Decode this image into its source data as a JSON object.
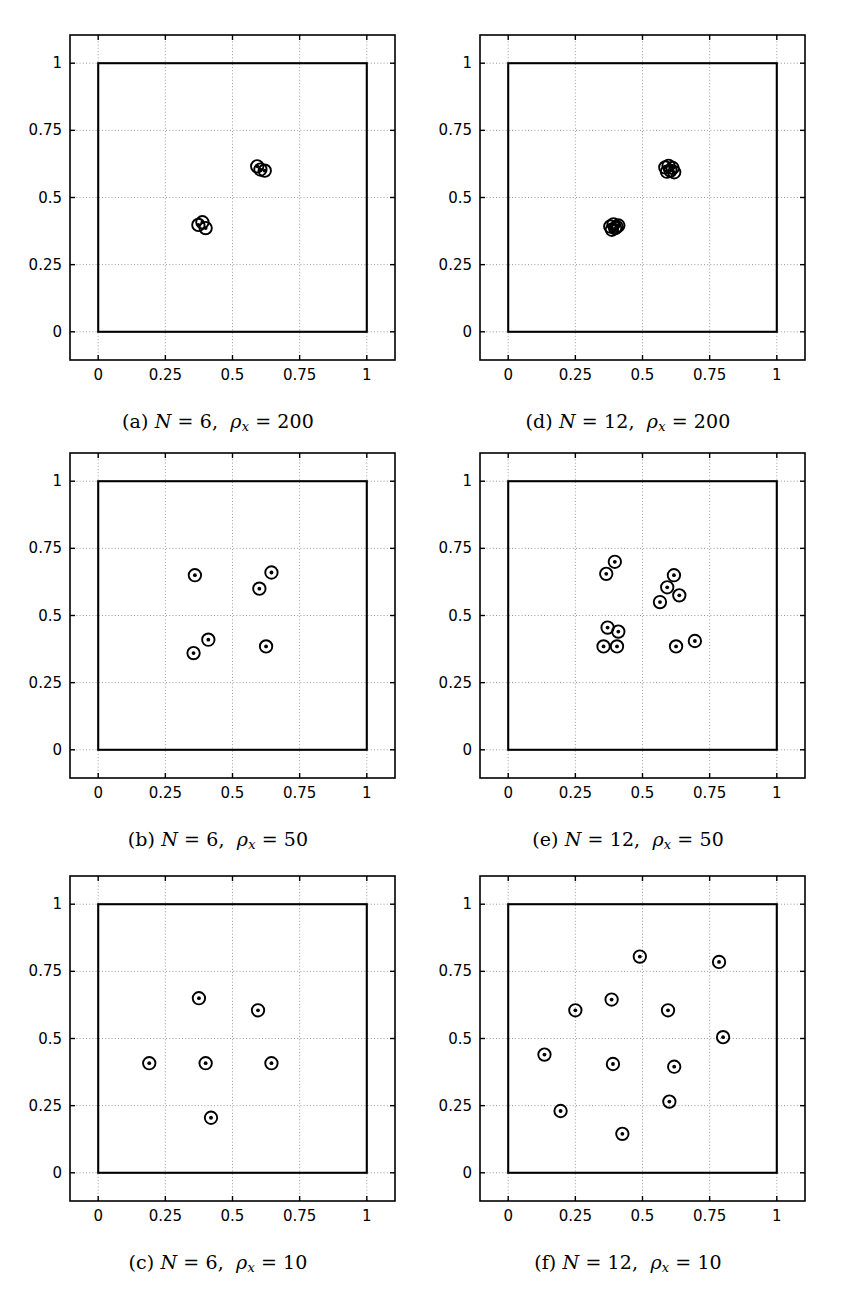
{
  "figure": {
    "title": "",
    "panel_count": 6,
    "columns": 2,
    "rows": 3
  },
  "axes": {
    "xticks": [
      "0",
      "0.25",
      "0.5",
      "0.75",
      "1"
    ],
    "yticks": [
      "0",
      "0.25",
      "0.5",
      "0.75",
      "1"
    ],
    "xtick_values": [
      0,
      0.25,
      0.5,
      0.75,
      1
    ],
    "ytick_values": [
      0,
      0.25,
      0.5,
      0.75,
      1
    ],
    "xlim": [
      -0.105,
      1.105
    ],
    "ylim": [
      -0.105,
      1.105
    ],
    "grid": "dotted",
    "unit_square": [
      0,
      0,
      1,
      1
    ],
    "marker": "circle-with-dot"
  },
  "chart_data": [
    {
      "id": "a",
      "type": "scatter",
      "title": "(a) N = 6, ρx = 200",
      "caption_parts": {
        "label": "(a)",
        "N_symbol": "N",
        "N_value": "6",
        "rho_symbol": "ρ",
        "rho_sub": "x",
        "rho_value": "200"
      },
      "xlabel": "",
      "ylabel": "",
      "xlim": [
        -0.105,
        1.105
      ],
      "ylim": [
        -0.105,
        1.105
      ],
      "xticks": [
        0,
        0.25,
        0.5,
        0.75,
        1
      ],
      "yticks": [
        0,
        0.25,
        0.5,
        0.75,
        1
      ],
      "n_points": 6,
      "x": [
        0.373,
        0.388,
        0.4,
        0.592,
        0.604,
        0.62
      ],
      "y": [
        0.398,
        0.408,
        0.386,
        0.616,
        0.604,
        0.6
      ]
    },
    {
      "id": "b",
      "type": "scatter",
      "title": "(b) N = 6, ρx = 50",
      "caption_parts": {
        "label": "(b)",
        "N_symbol": "N",
        "N_value": "6",
        "rho_symbol": "ρ",
        "rho_sub": "x",
        "rho_value": "50"
      },
      "xlabel": "",
      "ylabel": "",
      "xlim": [
        -0.105,
        1.105
      ],
      "ylim": [
        -0.105,
        1.105
      ],
      "xticks": [
        0,
        0.25,
        0.5,
        0.75,
        1
      ],
      "yticks": [
        0,
        0.25,
        0.5,
        0.75,
        1
      ],
      "n_points": 6,
      "x": [
        0.36,
        0.355,
        0.41,
        0.6,
        0.645,
        0.625
      ],
      "y": [
        0.65,
        0.36,
        0.41,
        0.6,
        0.66,
        0.385
      ]
    },
    {
      "id": "c",
      "type": "scatter",
      "title": "(c) N = 6, ρx = 10",
      "caption_parts": {
        "label": "(c)",
        "N_symbol": "N",
        "N_value": "6",
        "rho_symbol": "ρ",
        "rho_sub": "x",
        "rho_value": "10"
      },
      "xlabel": "",
      "ylabel": "",
      "xlim": [
        -0.105,
        1.105
      ],
      "ylim": [
        -0.105,
        1.105
      ],
      "xticks": [
        0,
        0.25,
        0.5,
        0.75,
        1
      ],
      "yticks": [
        0,
        0.25,
        0.5,
        0.75,
        1
      ],
      "n_points": 6,
      "x": [
        0.19,
        0.375,
        0.4,
        0.42,
        0.595,
        0.645
      ],
      "y": [
        0.408,
        0.65,
        0.408,
        0.205,
        0.605,
        0.408
      ]
    },
    {
      "id": "d",
      "type": "scatter",
      "title": "(d) N = 12, ρx = 200",
      "caption_parts": {
        "label": "(d)",
        "N_symbol": "N",
        "N_value": "12",
        "rho_symbol": "ρ",
        "rho_sub": "x",
        "rho_value": "200"
      },
      "xlabel": "",
      "ylabel": "",
      "xlim": [
        -0.105,
        1.105
      ],
      "ylim": [
        -0.105,
        1.105
      ],
      "xticks": [
        0,
        0.25,
        0.5,
        0.75,
        1
      ],
      "yticks": [
        0,
        0.25,
        0.5,
        0.75,
        1
      ],
      "n_points": 12,
      "x": [
        0.38,
        0.392,
        0.404,
        0.386,
        0.398,
        0.41,
        0.585,
        0.597,
        0.612,
        0.591,
        0.604,
        0.618
      ],
      "y": [
        0.392,
        0.4,
        0.39,
        0.38,
        0.386,
        0.396,
        0.612,
        0.618,
        0.61,
        0.596,
        0.6,
        0.594
      ]
    },
    {
      "id": "e",
      "type": "scatter",
      "title": "(e) N = 12, ρx = 50",
      "caption_parts": {
        "label": "(e)",
        "N_symbol": "N",
        "N_value": "12",
        "rho_symbol": "ρ",
        "rho_sub": "x",
        "rho_value": "50"
      },
      "xlabel": "",
      "ylabel": "",
      "xlim": [
        -0.105,
        1.105
      ],
      "ylim": [
        -0.105,
        1.105
      ],
      "xticks": [
        0,
        0.25,
        0.5,
        0.75,
        1
      ],
      "yticks": [
        0,
        0.25,
        0.5,
        0.75,
        1
      ],
      "n_points": 12,
      "x": [
        0.365,
        0.397,
        0.565,
        0.592,
        0.617,
        0.637,
        0.37,
        0.41,
        0.355,
        0.405,
        0.625,
        0.695
      ],
      "y": [
        0.655,
        0.7,
        0.55,
        0.605,
        0.65,
        0.575,
        0.455,
        0.44,
        0.385,
        0.385,
        0.385,
        0.405
      ]
    },
    {
      "id": "f",
      "type": "scatter",
      "title": "(f) N = 12, ρx = 10",
      "caption_parts": {
        "label": "(f)",
        "N_symbol": "N",
        "N_value": "12",
        "rho_symbol": "ρ",
        "rho_sub": "x",
        "rho_value": "10"
      },
      "xlabel": "",
      "ylabel": "",
      "xlim": [
        -0.105,
        1.105
      ],
      "ylim": [
        -0.105,
        1.105
      ],
      "xticks": [
        0,
        0.25,
        0.5,
        0.75,
        1
      ],
      "yticks": [
        0,
        0.25,
        0.5,
        0.75,
        1
      ],
      "n_points": 12,
      "x": [
        0.135,
        0.195,
        0.25,
        0.385,
        0.39,
        0.425,
        0.49,
        0.595,
        0.6,
        0.618,
        0.785,
        0.8
      ],
      "y": [
        0.44,
        0.23,
        0.605,
        0.645,
        0.405,
        0.145,
        0.805,
        0.605,
        0.265,
        0.395,
        0.785,
        0.505
      ]
    }
  ]
}
